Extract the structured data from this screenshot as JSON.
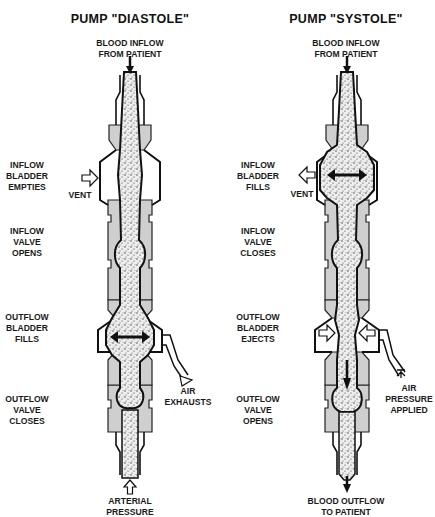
{
  "figure": {
    "panels": [
      {
        "title": "PUMP \"DIASTOLE\"",
        "top_label": [
          "BLOOD INFLOW",
          "FROM PATIENT"
        ],
        "bottom_label": [
          "ARTERIAL",
          "PRESSURE"
        ],
        "side_labels": [
          [
            "INFLOW",
            "BLADDER",
            "EMPTIES"
          ],
          [
            "INFLOW",
            "VALVE",
            "OPENS"
          ],
          [
            "OUTFLOW",
            "BLADDER",
            "FILLS"
          ],
          [
            "OUTFLOW",
            "VALVE",
            "CLOSES"
          ]
        ],
        "vent_label": "VENT",
        "air_label": [
          "AIR",
          "EXHAUSTS"
        ]
      },
      {
        "title": "PUMP \"SYSTOLE\"",
        "top_label": [
          "BLOOD INFLOW",
          "FROM PATIENT"
        ],
        "bottom_label": [
          "BLOOD OUTFLOW",
          "TO PATIENT"
        ],
        "side_labels": [
          [
            "INFLOW",
            "BLADDER",
            "FILLS"
          ],
          [
            "INFLOW",
            "VALVE",
            "CLOSES"
          ],
          [
            "OUTFLOW",
            "BLADDER",
            "EJECTS"
          ],
          [
            "OUTFLOW",
            "VALVE",
            "OPENS"
          ]
        ],
        "vent_label": "VENT",
        "air_label": [
          "AIR",
          "PRESSURE",
          "APPLIED"
        ]
      }
    ]
  },
  "colors": {
    "ink": "#111111",
    "housing": "#c8c8c8",
    "blood": "#e6e6e6",
    "background": "#ffffff"
  }
}
